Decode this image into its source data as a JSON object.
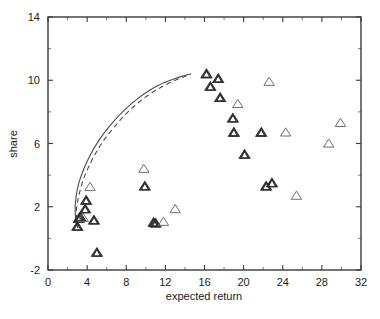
{
  "chart_data": {
    "type": "scatter",
    "title": "",
    "xlabel": "expected return",
    "ylabel": "share",
    "xlim": [
      0,
      32
    ],
    "ylim": [
      -2,
      14
    ],
    "xticks": [
      0,
      4,
      8,
      12,
      16,
      20,
      24,
      28,
      32
    ],
    "xtick_labels": [
      "0",
      "4",
      "8",
      "12",
      "16",
      "20",
      "24",
      "28",
      "32"
    ],
    "yticks": [
      -2,
      2,
      6,
      10,
      14
    ],
    "ytick_labels": [
      "-2",
      "2",
      "6",
      "10",
      "14"
    ],
    "yminor_ticks": [
      0,
      4,
      8,
      12
    ],
    "xminor_ticks": [
      2,
      6,
      10,
      14,
      18,
      22,
      26,
      30
    ],
    "grid": false,
    "legend": null,
    "series": [
      {
        "name": "observations",
        "marker": "triangle-up-open",
        "color": "#6f6f6f",
        "points": [
          {
            "x": 3.0,
            "y": 0.75,
            "weight": "dark"
          },
          {
            "x": 3.15,
            "y": 1.25,
            "weight": "dark"
          },
          {
            "x": 3.3,
            "y": 1.35,
            "weight": "dark"
          },
          {
            "x": 3.6,
            "y": 1.3,
            "weight": "open"
          },
          {
            "x": 3.8,
            "y": 1.85,
            "weight": "dark"
          },
          {
            "x": 3.9,
            "y": 2.4,
            "weight": "dark"
          },
          {
            "x": 4.3,
            "y": 3.25,
            "weight": "open"
          },
          {
            "x": 4.7,
            "y": 1.15,
            "weight": "dark"
          },
          {
            "x": 5.0,
            "y": -0.9,
            "weight": "dark"
          },
          {
            "x": 9.8,
            "y": 4.4,
            "weight": "open"
          },
          {
            "x": 9.9,
            "y": 3.3,
            "weight": "dark"
          },
          {
            "x": 10.8,
            "y": 1.0,
            "weight": "dark"
          },
          {
            "x": 11.0,
            "y": 0.95,
            "weight": "dark"
          },
          {
            "x": 11.8,
            "y": 1.05,
            "weight": "open"
          },
          {
            "x": 13.0,
            "y": 1.85,
            "weight": "open"
          },
          {
            "x": 16.2,
            "y": 10.4,
            "weight": "dark"
          },
          {
            "x": 16.6,
            "y": 9.6,
            "weight": "dark"
          },
          {
            "x": 17.4,
            "y": 10.1,
            "weight": "dark"
          },
          {
            "x": 17.6,
            "y": 8.9,
            "weight": "dark"
          },
          {
            "x": 18.9,
            "y": 7.6,
            "weight": "dark"
          },
          {
            "x": 19.0,
            "y": 6.7,
            "weight": "dark"
          },
          {
            "x": 19.4,
            "y": 8.5,
            "weight": "open"
          },
          {
            "x": 20.1,
            "y": 5.3,
            "weight": "dark"
          },
          {
            "x": 21.8,
            "y": 6.7,
            "weight": "dark"
          },
          {
            "x": 22.3,
            "y": 3.3,
            "weight": "dark"
          },
          {
            "x": 22.6,
            "y": 9.9,
            "weight": "open"
          },
          {
            "x": 22.9,
            "y": 3.5,
            "weight": "dark"
          },
          {
            "x": 24.3,
            "y": 6.7,
            "weight": "open"
          },
          {
            "x": 25.4,
            "y": 2.7,
            "weight": "open"
          },
          {
            "x": 28.7,
            "y": 6.0,
            "weight": "open"
          },
          {
            "x": 29.9,
            "y": 7.3,
            "weight": "open"
          }
        ]
      }
    ],
    "curves": [
      {
        "name": "frontier-solid",
        "style": "solid",
        "color": "#4a4a4a",
        "points": [
          {
            "x": 3.05,
            "y": 0.65
          },
          {
            "x": 2.85,
            "y": 1.15
          },
          {
            "x": 2.78,
            "y": 1.7
          },
          {
            "x": 2.8,
            "y": 2.25
          },
          {
            "x": 2.95,
            "y": 2.95
          },
          {
            "x": 3.25,
            "y": 3.7
          },
          {
            "x": 3.7,
            "y": 4.45
          },
          {
            "x": 4.35,
            "y": 5.3
          },
          {
            "x": 5.2,
            "y": 6.2
          },
          {
            "x": 6.3,
            "y": 7.1
          },
          {
            "x": 7.7,
            "y": 8.05
          },
          {
            "x": 9.3,
            "y": 8.9
          },
          {
            "x": 11.2,
            "y": 9.65
          },
          {
            "x": 13.2,
            "y": 10.15
          },
          {
            "x": 14.6,
            "y": 10.4
          }
        ]
      },
      {
        "name": "frontier-dashed",
        "style": "dashed",
        "color": "#4a4a4a",
        "points": [
          {
            "x": 3.05,
            "y": 0.65
          },
          {
            "x": 2.92,
            "y": 1.15
          },
          {
            "x": 2.9,
            "y": 1.7
          },
          {
            "x": 3.0,
            "y": 2.25
          },
          {
            "x": 3.25,
            "y": 2.95
          },
          {
            "x": 3.6,
            "y": 3.7
          },
          {
            "x": 4.1,
            "y": 4.45
          },
          {
            "x": 4.8,
            "y": 5.3
          },
          {
            "x": 5.7,
            "y": 6.2
          },
          {
            "x": 6.85,
            "y": 7.1
          },
          {
            "x": 8.25,
            "y": 8.05
          },
          {
            "x": 9.9,
            "y": 8.9
          },
          {
            "x": 11.7,
            "y": 9.6
          },
          {
            "x": 13.4,
            "y": 10.1
          },
          {
            "x": 14.6,
            "y": 10.38
          }
        ]
      }
    ]
  }
}
